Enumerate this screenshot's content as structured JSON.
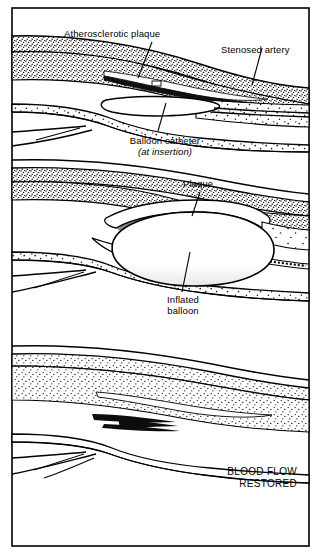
{
  "figure": {
    "title_visible": false,
    "panels": [
      {
        "id": "panel-stenosis",
        "labels": [
          {
            "name": "atherosclerotic-plaque",
            "text": "Atherosclerotic plaque"
          },
          {
            "name": "stenosed-artery",
            "text": "Stenosed artery"
          },
          {
            "name": "balloon-catheter",
            "text": "Balloon catheter"
          },
          {
            "name": "balloon-catheter-sub",
            "text": "(at insertion)"
          }
        ]
      },
      {
        "id": "panel-inflation",
        "labels": [
          {
            "name": "plaque",
            "text": "Plaque"
          },
          {
            "name": "inflated-balloon-line1",
            "text": "Inflated"
          },
          {
            "name": "inflated-balloon-line2",
            "text": "balloon"
          }
        ]
      },
      {
        "id": "panel-restored",
        "labels": [
          {
            "name": "blood-flow-line1",
            "text": "BLOOD FLOW"
          },
          {
            "name": "blood-flow-line2",
            "text": "RESTORED"
          }
        ]
      }
    ]
  },
  "colors": {
    "ink": "#000000",
    "paper": "#ffffff",
    "stipple": "#1a1a1a"
  }
}
